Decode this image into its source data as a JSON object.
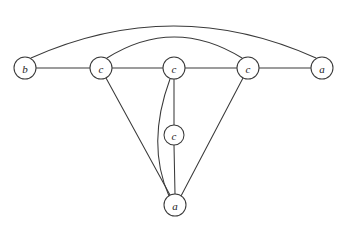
{
  "figure": {
    "background_color": "#ffffff",
    "stroke_color": "#3a3a3a",
    "label_color": "#1c1c1c",
    "width": 344,
    "height": 227
  },
  "nodes": [
    {
      "id": "n1",
      "label": "b",
      "cx": 25,
      "cy": 68,
      "r": 11
    },
    {
      "id": "n2",
      "label": "c",
      "cx": 101,
      "cy": 68,
      "r": 11
    },
    {
      "id": "n3",
      "label": "c",
      "cx": 174,
      "cy": 68,
      "r": 11
    },
    {
      "id": "n4",
      "label": "c",
      "cx": 248,
      "cy": 68,
      "r": 11
    },
    {
      "id": "n5",
      "label": "a",
      "cx": 322,
      "cy": 68,
      "r": 11
    },
    {
      "id": "n6",
      "label": "c",
      "cx": 174,
      "cy": 135,
      "r": 10
    },
    {
      "id": "n7",
      "label": "a",
      "cx": 175,
      "cy": 205,
      "r": 11
    }
  ],
  "edges": [
    {
      "id": "e1",
      "from": "n1",
      "to": "n2",
      "kind": "straight"
    },
    {
      "id": "e2",
      "from": "n2",
      "to": "n3",
      "kind": "straight"
    },
    {
      "id": "e3",
      "from": "n3",
      "to": "n4",
      "kind": "straight"
    },
    {
      "id": "e4",
      "from": "n4",
      "to": "n5",
      "kind": "straight"
    },
    {
      "id": "e5",
      "from": "n1",
      "to": "n5",
      "kind": "arc-outer"
    },
    {
      "id": "e6",
      "from": "n2",
      "to": "n4",
      "kind": "arc-inner"
    },
    {
      "id": "e7",
      "from": "n2",
      "to": "n7",
      "kind": "straight"
    },
    {
      "id": "e8",
      "from": "n3",
      "to": "n7",
      "kind": "arc-left"
    },
    {
      "id": "e9",
      "from": "n3",
      "to": "n6",
      "kind": "straight"
    },
    {
      "id": "e10",
      "from": "n6",
      "to": "n7",
      "kind": "straight"
    },
    {
      "id": "e11",
      "from": "n4",
      "to": "n7",
      "kind": "straight"
    }
  ],
  "edge_paths": {
    "e1": "M 36 68 L 90 68",
    "e2": "M 112 68 L 163 68",
    "e3": "M 185 68 L 237 68",
    "e4": "M 259 68 L 311 68",
    "e5": "M 31 58 Q 174 -6 316 58",
    "e6": "M 107 58 Q 174 16 242 58",
    "e7": "M 106 78 L 170 195",
    "e8": "M 170 79 Q 146 144 169 196",
    "e9": "M 174 79 L 174 125",
    "e10": "M 174 145 L 175 194",
    "e11": "M 243 78 L 181 196"
  },
  "legend": {
    "node_labels_used": [
      "a",
      "b",
      "c"
    ]
  }
}
